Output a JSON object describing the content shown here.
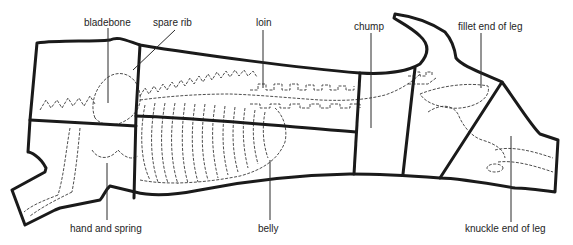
{
  "diagram": {
    "line_color": "#1a1a1a",
    "background": "#ffffff"
  },
  "labels": {
    "bladebone": "bladebone",
    "spare_rib": "spare rib",
    "loin": "loin",
    "chump": "chump",
    "fillet_end_of_leg": "fillet end of leg",
    "hand_and_spring": "hand and spring",
    "belly": "belly",
    "knuckle_end_of_leg": "knuckle end of leg"
  },
  "cuts": [
    {
      "name": "bladebone",
      "label_pos": [
        84,
        17
      ],
      "leader": [
        [
          108,
          28
        ],
        [
          108,
          103
        ]
      ]
    },
    {
      "name": "spare rib",
      "label_pos": [
        153,
        17
      ],
      "leader": [
        [
          175,
          30
        ],
        [
          133,
          70
        ]
      ]
    },
    {
      "name": "loin",
      "label_pos": [
        256,
        17
      ],
      "leader": [
        [
          263,
          30
        ],
        [
          263,
          88
        ]
      ]
    },
    {
      "name": "chump",
      "label_pos": [
        354,
        21
      ],
      "leader": [
        [
          371,
          33
        ],
        [
          371,
          128
        ]
      ]
    },
    {
      "name": "fillet end of leg",
      "label_pos": [
        458,
        21
      ],
      "leader": [
        [
          481,
          33
        ],
        [
          481,
          88
        ]
      ]
    },
    {
      "name": "hand and spring",
      "label_pos": [
        70,
        224
      ],
      "leader": [
        [
          107,
          163
        ],
        [
          107,
          220
        ]
      ]
    },
    {
      "name": "belly",
      "label_pos": [
        258,
        224
      ],
      "leader": [
        [
          270,
          160
        ],
        [
          270,
          220
        ]
      ]
    },
    {
      "name": "knuckle end of leg",
      "label_pos": [
        465,
        224
      ],
      "leader": [
        [
          511,
          136
        ],
        [
          511,
          222
        ]
      ]
    }
  ]
}
